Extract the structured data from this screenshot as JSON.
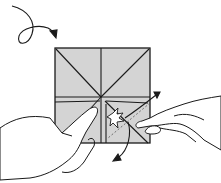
{
  "diagram": {
    "type": "origami-instruction-step",
    "colors": {
      "paper": "#d4d4d4",
      "line": "#1a1a1a",
      "background": "#ffffff"
    },
    "symbols": [
      "turn-over-arrow",
      "pull-arrow-up-right",
      "pull-arrow-down-left",
      "action-star"
    ]
  }
}
